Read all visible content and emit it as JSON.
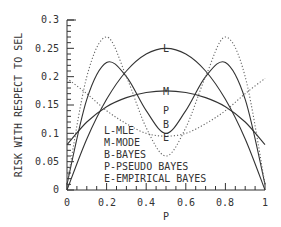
{
  "chart_data": {
    "type": "line",
    "title": "",
    "xlabel": "P",
    "ylabel": "RISK WITH RESPECT TO SEL",
    "xlim": [
      0,
      1
    ],
    "ylim": [
      0,
      0.3
    ],
    "x_ticks": [
      "0",
      "0.2",
      "0.4",
      "0.6",
      "0.8",
      "1"
    ],
    "y_ticks": [
      "0",
      "0.05",
      "0.1",
      "0.15",
      "0.2",
      "0.25",
      "0.3"
    ],
    "grid": false,
    "legend": {
      "position": "lower-center-inside",
      "entries": [
        "L-MLE",
        "M-MODE",
        "B-BAYES",
        "P-PSEUDO BAYES",
        "E-EMPIRICAL BAYES"
      ]
    },
    "x": [
      0,
      0.1,
      0.2,
      0.3,
      0.4,
      0.5,
      0.6,
      0.7,
      0.8,
      0.9,
      1.0
    ],
    "series": [
      {
        "name": "L",
        "label": "MLE",
        "style": "solid",
        "values": [
          0.0,
          0.09,
          0.16,
          0.21,
          0.24,
          0.25,
          0.24,
          0.21,
          0.16,
          0.09,
          0.0
        ]
      },
      {
        "name": "M",
        "label": "MODE",
        "style": "solid",
        "values": [
          0.08,
          0.12,
          0.147,
          0.163,
          0.172,
          0.175,
          0.172,
          0.163,
          0.147,
          0.12,
          0.08
        ]
      },
      {
        "name": "P",
        "label": "PSEUDO BAYES",
        "style": "solid",
        "values": [
          0.01,
          0.16,
          0.225,
          0.2,
          0.14,
          0.1,
          0.14,
          0.2,
          0.225,
          0.16,
          0.01
        ]
      },
      {
        "name": "B",
        "label": "BAYES",
        "style": "dotted",
        "values": [
          0.197,
          0.17,
          0.14,
          0.117,
          0.1,
          0.095,
          0.1,
          0.117,
          0.14,
          0.17,
          0.197
        ]
      },
      {
        "name": "E",
        "label": "EMPIRICAL BAYES",
        "style": "dotted",
        "values": [
          0.01,
          0.2,
          0.27,
          0.2,
          0.11,
          0.06,
          0.11,
          0.2,
          0.27,
          0.2,
          0.01
        ]
      }
    ],
    "annotations": [
      "L",
      "M",
      "P",
      "B",
      "E"
    ]
  },
  "axis": {
    "ylabel": "RISK WITH RESPECT TO SEL",
    "xlabel": "P",
    "y_ticks": [
      "0",
      "0.05",
      "0.1",
      "0.15",
      "0.2",
      "0.25",
      "0.3"
    ],
    "x_ticks": [
      "0",
      "0.2",
      "0.4",
      "0.6",
      "0.8",
      "1"
    ]
  },
  "legend": {
    "line1": "L-MLE",
    "line2": "M-MODE",
    "line3": "B-BAYES",
    "line4": "P-PSEUDO BAYES",
    "line5": "E-EMPIRICAL BAYES"
  },
  "curve_labels": {
    "L": "L",
    "M": "M",
    "P": "P",
    "B": "B",
    "E": "E"
  }
}
